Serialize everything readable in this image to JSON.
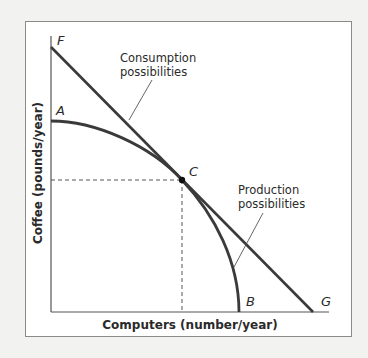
{
  "diagram": {
    "type": "production-possibilities-diagram",
    "x_axis_label": "Computers (number/year)",
    "y_axis_label": "Coffee (pounds/year)",
    "points": {
      "A": "A",
      "B": "B",
      "C": "C",
      "F": "F",
      "G": "G"
    },
    "annotations": {
      "consumption_line1": "Consumption",
      "consumption_line2": "possibilities",
      "production_line1": "Production",
      "production_line2": "possibilities"
    },
    "colors": {
      "curve": "#3a3a3a",
      "axis": "#555555",
      "background": "#ffffff",
      "page": "#f2f2f1"
    }
  }
}
